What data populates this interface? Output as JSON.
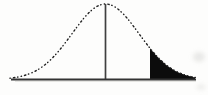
{
  "figure": {
    "name": "normal-distribution-right-tail-shaded",
    "background_color": "#fdfdfc",
    "curve": {
      "type": "gaussian",
      "style": "dotted",
      "color": "#1f1f1f",
      "stroke_width": 1.4,
      "dash_pattern": "0.4 3.1 1.4 2.7 0.4 3.3",
      "mu": 105.5,
      "sigma": 33.5,
      "amplitude": 75.5,
      "baseline_y": 79.5,
      "x_start": 10,
      "x_end": 196
    },
    "mean_line": {
      "x": 105.5,
      "y_top": 4,
      "color": "#404040",
      "width": 1.7
    },
    "baseline": {
      "x_start": 11,
      "x_end": 196,
      "y": 79.5,
      "color": "#333333",
      "width": 2.2,
      "shadow_color": "#c9c9c4"
    },
    "shaded_tail": {
      "side": "right",
      "x_start": 150,
      "x_end": 195,
      "fill": "#0c0c0c"
    }
  }
}
